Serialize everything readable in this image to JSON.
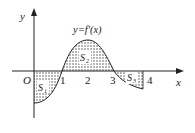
{
  "figure": {
    "curve_label": "y=f′(x)",
    "axis_x_label": "x",
    "axis_y_label": "y",
    "origin_label": "O",
    "ticks": [
      "1",
      "2",
      "3",
      "4"
    ],
    "regions": [
      {
        "name": "S1",
        "label": "S",
        "sub": "1"
      },
      {
        "name": "S2",
        "label": "S",
        "sub": "2"
      },
      {
        "name": "S3",
        "label": "S",
        "sub": "3"
      }
    ],
    "colors": {
      "ink": "#222222",
      "background": "#ffffff"
    }
  }
}
